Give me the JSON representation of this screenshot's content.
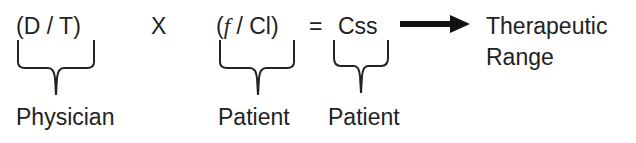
{
  "equation": {
    "term1": {
      "open": "(",
      "num": "D",
      "sep": " / ",
      "den": "T",
      "close": ")",
      "label": "Physician"
    },
    "operator_times": "X",
    "term2": {
      "open": "(",
      "num": "f",
      "sep": " / ",
      "den": "Cl",
      "close": ")",
      "label": "Patient"
    },
    "operator_equals": "=",
    "result": {
      "text": "Css",
      "label": "Patient"
    },
    "outcome": {
      "line1": "Therapeutic",
      "line2": "Range"
    }
  },
  "colors": {
    "text": "#222222",
    "arrow": "#111111"
  }
}
